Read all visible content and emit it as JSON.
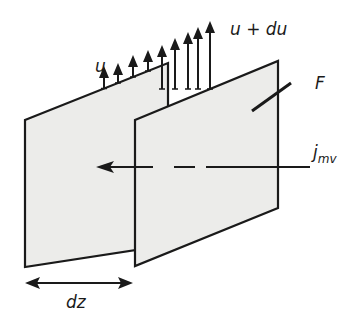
{
  "diagram": {
    "labels": {
      "u": "u",
      "u_du": "u + du",
      "F": "F",
      "j_main": "j",
      "j_sub": "mv",
      "dz": "dz"
    },
    "colors": {
      "stroke": "#1a1a1a",
      "plate_fill": "#ececea",
      "background": "#ffffff"
    },
    "velocity_arrows": [
      {
        "x": 42,
        "base": 90,
        "tip": 70
      },
      {
        "x": 57,
        "base": 90,
        "tip": 70
      },
      {
        "x": 74,
        "base": 90,
        "tip": 60
      },
      {
        "x": 91,
        "base": 90,
        "tip": 54
      },
      {
        "x": 104,
        "base": 90,
        "tip": 48
      },
      {
        "x": 119,
        "base": 89,
        "tip": 44
      },
      {
        "x": 134,
        "base": 89,
        "tip": 37
      },
      {
        "x": 148,
        "base": 89,
        "tip": 33
      },
      {
        "x": 163,
        "base": 89,
        "tip": 27
      },
      {
        "x": 177,
        "base": 89,
        "tip": 25
      },
      {
        "x": 190,
        "base": 89,
        "tip": 20
      },
      {
        "x": 209,
        "base": 89,
        "tip": 23
      }
    ]
  }
}
